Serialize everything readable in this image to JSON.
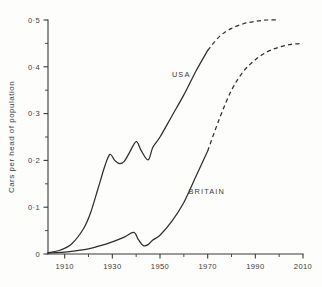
{
  "chart_data": {
    "type": "line",
    "title": "",
    "xlabel": "",
    "ylabel": "Cars per head of population",
    "xlim": [
      1903,
      2010
    ],
    "ylim": [
      0,
      0.5
    ],
    "grid": false,
    "legend_position": "inline-annotation",
    "y_ticks": [
      {
        "value": 0,
        "label": "0"
      },
      {
        "value": 0.1,
        "label": "0·1"
      },
      {
        "value": 0.2,
        "label": "0·2"
      },
      {
        "value": 0.3,
        "label": "0·3"
      },
      {
        "value": 0.4,
        "label": "0·4"
      },
      {
        "value": 0.5,
        "label": "0·5"
      }
    ],
    "y_minor_ticks": [
      0.05,
      0.15,
      0.25,
      0.35,
      0.45
    ],
    "x_ticks": [
      {
        "value": 1910,
        "label": "1910"
      },
      {
        "value": 1930,
        "label": "1930"
      },
      {
        "value": 1950,
        "label": "1950"
      },
      {
        "value": 1970,
        "label": "1970"
      },
      {
        "value": 1990,
        "label": "1990"
      },
      {
        "value": 2010,
        "label": "2010"
      }
    ],
    "x_minor_ticks": [
      1920,
      1940,
      1960,
      1980,
      2000
    ],
    "series": [
      {
        "name": "USA",
        "label": "USA",
        "color": "#2e2e2e",
        "solid_until": 1970,
        "x": [
          1903,
          1908,
          1913,
          1918,
          1921,
          1924,
          1927,
          1929,
          1931,
          1933,
          1935,
          1937,
          1940,
          1942,
          1945,
          1947,
          1950,
          1955,
          1960,
          1965,
          1970,
          1975,
          1980,
          1985,
          1990,
          1995,
          2000
        ],
        "values": [
          0.003,
          0.008,
          0.022,
          0.055,
          0.09,
          0.14,
          0.19,
          0.213,
          0.2,
          0.193,
          0.198,
          0.215,
          0.24,
          0.222,
          0.201,
          0.228,
          0.25,
          0.295,
          0.34,
          0.39,
          0.435,
          0.465,
          0.482,
          0.492,
          0.497,
          0.5,
          0.5
        ]
      },
      {
        "name": "BRITAIN",
        "label": "BRITAIN",
        "color": "#2e2e2e",
        "solid_until": 1970,
        "x": [
          1903,
          1910,
          1915,
          1920,
          1925,
          1930,
          1935,
          1939,
          1941,
          1943,
          1945,
          1947,
          1950,
          1955,
          1960,
          1965,
          1970,
          1975,
          1980,
          1985,
          1990,
          1995,
          2000,
          2005,
          2010
        ],
        "values": [
          0.002,
          0.004,
          0.007,
          0.011,
          0.018,
          0.026,
          0.036,
          0.046,
          0.03,
          0.018,
          0.02,
          0.03,
          0.04,
          0.07,
          0.11,
          0.165,
          0.22,
          0.29,
          0.35,
          0.39,
          0.415,
          0.432,
          0.442,
          0.448,
          0.45
        ]
      }
    ],
    "annotations": [
      {
        "text": "USA",
        "x": 1955,
        "y": 0.378
      },
      {
        "text": "BRITAIN",
        "x": 1962,
        "y": 0.128
      }
    ]
  }
}
